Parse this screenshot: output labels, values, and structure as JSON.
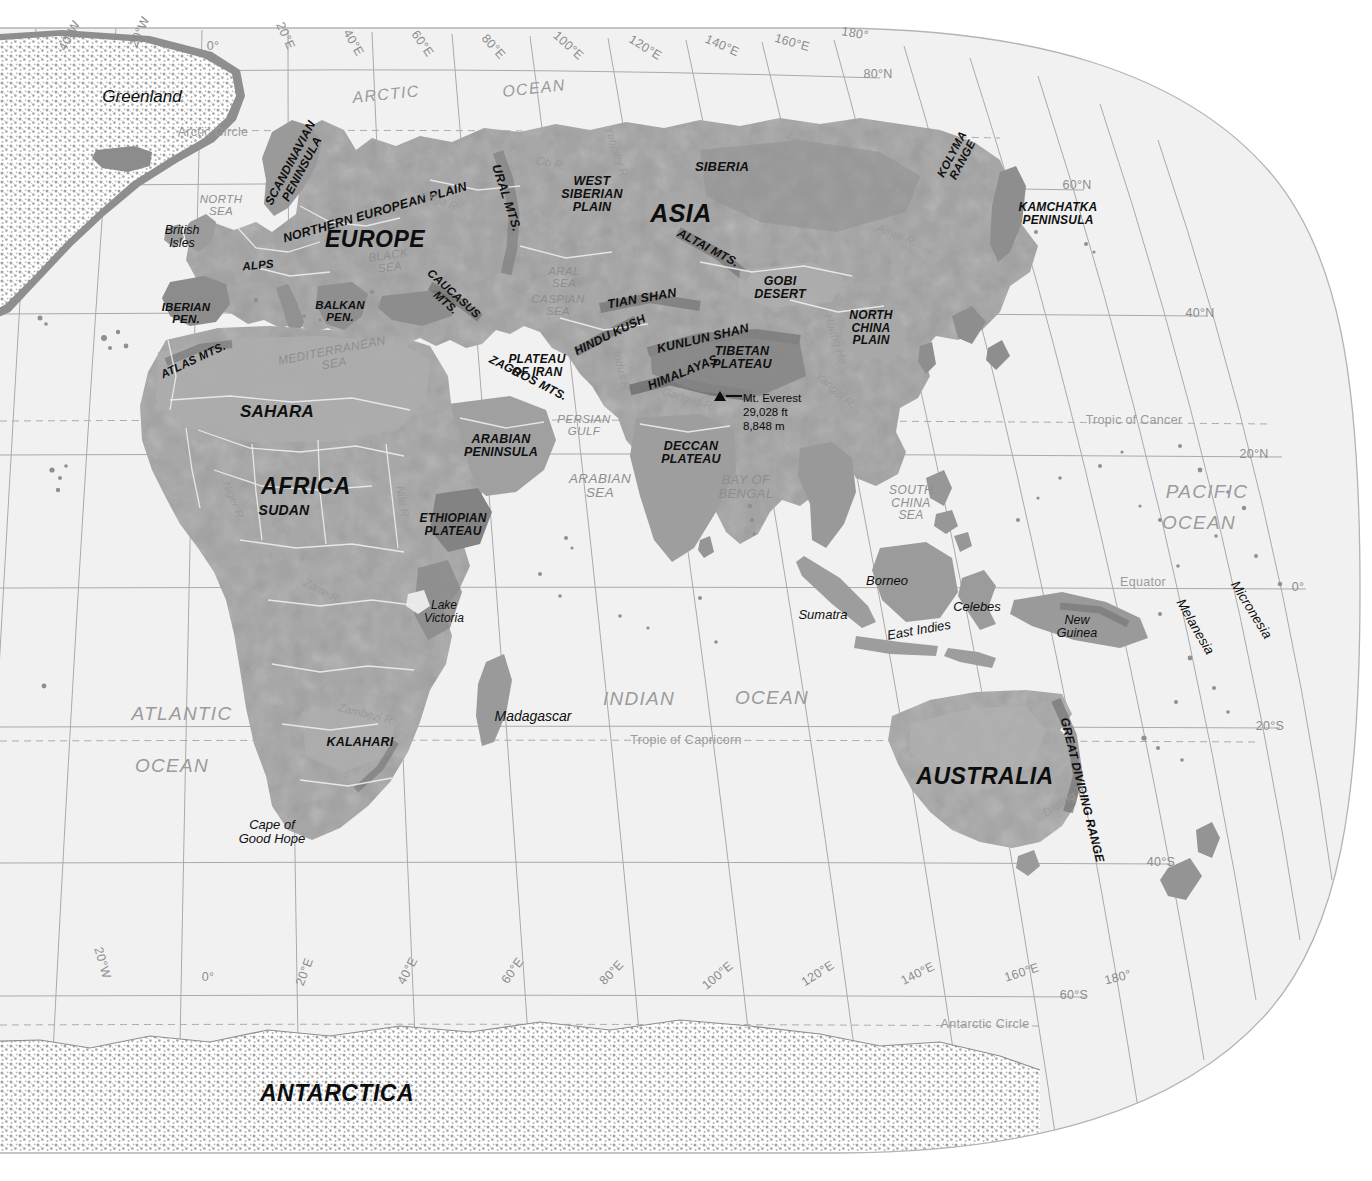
{
  "map": {
    "title": "Physical World Map - Eastern Hemisphere",
    "projection": "oval / interrupted pseudocylindrical",
    "colors": {
      "ocean": "#f1f1f1",
      "land_low": "#a9a9a9",
      "land_mid": "#9a9a9a",
      "land_high": "#868686",
      "land_shadow": "#767676",
      "ice": "#ffffff",
      "graticule": "#9d9d9d",
      "border": "#efefef",
      "label_dark": "#101010",
      "label_water": "#8e8e8e"
    }
  },
  "continents": [
    {
      "label": "EUROPE",
      "x": 375,
      "y": 239,
      "size": 23,
      "rot": 0
    },
    {
      "label": "ASIA",
      "x": 681,
      "y": 213,
      "size": 25,
      "rot": 0
    },
    {
      "label": "AFRICA",
      "x": 306,
      "y": 486,
      "size": 23,
      "rot": 0
    },
    {
      "label": "AUSTRALIA",
      "x": 985,
      "y": 776,
      "size": 23,
      "rot": 0
    },
    {
      "label": "ANTARCTICA",
      "x": 337,
      "y": 1093,
      "size": 23,
      "rot": 0
    }
  ],
  "features": [
    {
      "label": "SCANDINAVIAN\nPENINSULA",
      "x": 296,
      "y": 166,
      "size": 12,
      "rot": -62
    },
    {
      "label": "NORTHERN EUROPEAN PLAIN",
      "x": 375,
      "y": 213,
      "size": 12.5,
      "rot": -16
    },
    {
      "label": "URAL MTS.",
      "x": 506,
      "y": 198,
      "size": 12.5,
      "rot": 72
    },
    {
      "label": "WEST\nSIBERIAN\nPLAIN",
      "x": 592,
      "y": 195,
      "size": 12.5,
      "rot": 0
    },
    {
      "label": "SIBERIA",
      "x": 722,
      "y": 167,
      "size": 13,
      "rot": 0
    },
    {
      "label": "KOLYMA\nRANGE",
      "x": 957,
      "y": 157,
      "size": 11.5,
      "rot": -62
    },
    {
      "label": "KAMCHATKA\nPENINSULA",
      "x": 1058,
      "y": 214,
      "size": 12,
      "rot": 0
    },
    {
      "label": "ALTAI MTS.",
      "x": 708,
      "y": 248,
      "size": 12,
      "rot": 28
    },
    {
      "label": "ALPS",
      "x": 258,
      "y": 265,
      "size": 11.5,
      "rot": -6
    },
    {
      "label": "IBERIAN\nPEN.",
      "x": 186,
      "y": 313,
      "size": 11.5,
      "rot": 0
    },
    {
      "label": "BALKAN\nPEN.",
      "x": 340,
      "y": 311,
      "size": 11.5,
      "rot": 0
    },
    {
      "label": "CAUCASUS\nMTS.",
      "x": 450,
      "y": 298,
      "size": 11.5,
      "rot": 42
    },
    {
      "label": "ATLAS MTS.",
      "x": 193,
      "y": 360,
      "size": 11.5,
      "rot": -25
    },
    {
      "label": "SAHARA",
      "x": 277,
      "y": 412,
      "size": 17,
      "rot": 0
    },
    {
      "label": "SUDAN",
      "x": 284,
      "y": 510,
      "size": 14,
      "rot": 0
    },
    {
      "label": "ETHIOPIAN\nPLATEAU",
      "x": 453,
      "y": 525,
      "size": 12,
      "rot": 0
    },
    {
      "label": "ARABIAN\nPENINSULA",
      "x": 501,
      "y": 446,
      "size": 12.5,
      "rot": 0
    },
    {
      "label": "PLATEAU\nOF IRAN",
      "x": 537,
      "y": 366,
      "size": 12,
      "rot": 0
    },
    {
      "label": "ZAGROS MTS.",
      "x": 528,
      "y": 378,
      "size": 12,
      "rot": 27
    },
    {
      "label": "HINDU KUSH",
      "x": 610,
      "y": 335,
      "size": 12,
      "rot": -26
    },
    {
      "label": "TIAN SHAN",
      "x": 642,
      "y": 299,
      "size": 12.5,
      "rot": -10
    },
    {
      "label": "KUNLUN SHAN",
      "x": 703,
      "y": 339,
      "size": 12.5,
      "rot": -13
    },
    {
      "label": "TIBETAN\nPLATEAU",
      "x": 742,
      "y": 358,
      "size": 12.5,
      "rot": 0
    },
    {
      "label": "HIMALAYAS",
      "x": 683,
      "y": 373,
      "size": 12.5,
      "rot": -22
    },
    {
      "label": "GOBI\nDESERT",
      "x": 780,
      "y": 288,
      "size": 12.5,
      "rot": 0
    },
    {
      "label": "NORTH\nCHINA\nPLAIN",
      "x": 871,
      "y": 328,
      "size": 12,
      "rot": 0
    },
    {
      "label": "DECCAN\nPLATEAU",
      "x": 691,
      "y": 453,
      "size": 12.5,
      "rot": 0
    },
    {
      "label": "KALAHARI",
      "x": 360,
      "y": 743,
      "size": 12.5,
      "rot": 0
    },
    {
      "label": "GREAT DIVIDING RANGE",
      "x": 1082,
      "y": 790,
      "size": 12,
      "rot": 76
    }
  ],
  "places": [
    {
      "label": "Greenland",
      "x": 142,
      "y": 97,
      "size": 17,
      "rot": 0
    },
    {
      "label": "British\nIsles",
      "x": 182,
      "y": 237,
      "size": 12.5,
      "rot": 0
    },
    {
      "label": "Borneo",
      "x": 887,
      "y": 581,
      "size": 13,
      "rot": 0
    },
    {
      "label": "Sumatra",
      "x": 823,
      "y": 615,
      "size": 13,
      "rot": 0
    },
    {
      "label": "Celebes",
      "x": 977,
      "y": 607,
      "size": 13,
      "rot": 0
    },
    {
      "label": "East Indies",
      "x": 919,
      "y": 630,
      "size": 13,
      "rot": -10
    },
    {
      "label": "New\nGuinea",
      "x": 1077,
      "y": 627,
      "size": 12.5,
      "rot": 0
    },
    {
      "label": "Madagascar",
      "x": 533,
      "y": 716,
      "size": 14,
      "rot": 0
    },
    {
      "label": "Lake\nVictoria",
      "x": 444,
      "y": 612,
      "size": 12,
      "rot": 0
    },
    {
      "label": "Micronesia",
      "x": 1251,
      "y": 610,
      "size": 13.5,
      "rot": 58
    },
    {
      "label": "Melanesia",
      "x": 1195,
      "y": 627,
      "size": 13.5,
      "rot": 60
    },
    {
      "label": "Cape of\nGood Hope",
      "x": 272,
      "y": 832,
      "size": 13,
      "rot": 0
    }
  ],
  "waters": [
    {
      "label": "ARCTIC",
      "x": 386,
      "y": 95,
      "size": 16,
      "rot": -6,
      "cls": "water-big"
    },
    {
      "label": "OCEAN",
      "x": 534,
      "y": 89,
      "size": 16,
      "rot": -6,
      "cls": "water-big"
    },
    {
      "label": "NORTH\nSEA",
      "x": 221,
      "y": 205,
      "size": 11.5,
      "rot": 0,
      "cls": "water"
    },
    {
      "label": "BLACK\nSEA",
      "x": 389,
      "y": 261,
      "size": 11.5,
      "rot": -8,
      "cls": "water"
    },
    {
      "label": "ARAL\nSEA",
      "x": 564,
      "y": 277,
      "size": 11.5,
      "rot": 0,
      "cls": "water"
    },
    {
      "label": "CASPIAN\nSEA",
      "x": 558,
      "y": 305,
      "size": 11.5,
      "rot": 0,
      "cls": "water"
    },
    {
      "label": "MEDITERRANEAN\nSEA",
      "x": 333,
      "y": 357,
      "size": 12,
      "rot": -11,
      "cls": "water"
    },
    {
      "label": "PERSIAN\nGULF",
      "x": 584,
      "y": 425,
      "size": 11.5,
      "rot": 0,
      "cls": "water"
    },
    {
      "label": "ARABIAN\nSEA",
      "x": 600,
      "y": 486,
      "size": 13.5,
      "rot": 0,
      "cls": "water"
    },
    {
      "label": "BAY OF\nBENGAL",
      "x": 746,
      "y": 487,
      "size": 13,
      "rot": 0,
      "cls": "water"
    },
    {
      "label": "SOUTH\nCHINA\nSEA",
      "x": 911,
      "y": 503,
      "size": 12,
      "rot": 0,
      "cls": "water"
    },
    {
      "label": "PACIFIC",
      "x": 1207,
      "y": 492,
      "size": 19,
      "rot": 0,
      "cls": "water-big"
    },
    {
      "label": "OCEAN",
      "x": 1199,
      "y": 523,
      "size": 19,
      "rot": 0,
      "cls": "water-big"
    },
    {
      "label": "INDIAN",
      "x": 639,
      "y": 699,
      "size": 19,
      "rot": 0,
      "cls": "water-big"
    },
    {
      "label": "OCEAN",
      "x": 772,
      "y": 698,
      "size": 19,
      "rot": 0,
      "cls": "water-big"
    },
    {
      "label": "ATLANTIC",
      "x": 182,
      "y": 714,
      "size": 19,
      "rot": 0,
      "cls": "water-big"
    },
    {
      "label": "OCEAN",
      "x": 172,
      "y": 766,
      "size": 19,
      "rot": 0,
      "cls": "water-big"
    }
  ],
  "rivers": [
    {
      "label": "Volga R.",
      "x": 440,
      "y": 200,
      "size": 11.5,
      "rot": 22
    },
    {
      "label": "Ob R.",
      "x": 551,
      "y": 163,
      "size": 11.5,
      "rot": 10
    },
    {
      "label": "Yenisey R.",
      "x": 617,
      "y": 153,
      "size": 11.5,
      "rot": 72
    },
    {
      "label": "Lena R.",
      "x": 805,
      "y": 146,
      "size": 11.5,
      "rot": 36
    },
    {
      "label": "Amur R.",
      "x": 897,
      "y": 235,
      "size": 11.5,
      "rot": 22
    },
    {
      "label": "L. Baikal",
      "x": 809,
      "y": 217,
      "size": 11.5,
      "rot": 8
    },
    {
      "label": "Huang He",
      "x": 836,
      "y": 339,
      "size": 11.5,
      "rot": 72
    },
    {
      "label": "Yangzi R.",
      "x": 836,
      "y": 390,
      "size": 11.5,
      "rot": 40
    },
    {
      "label": "Indus R.",
      "x": 622,
      "y": 372,
      "size": 11.5,
      "rot": 76
    },
    {
      "label": "Ganges R.",
      "x": 689,
      "y": 399,
      "size": 11.5,
      "rot": 17
    },
    {
      "label": "Niger R.",
      "x": 234,
      "y": 501,
      "size": 11.5,
      "rot": 68
    },
    {
      "label": "Nile R.",
      "x": 403,
      "y": 503,
      "size": 11.5,
      "rot": 80
    },
    {
      "label": "Zaire R.",
      "x": 323,
      "y": 591,
      "size": 11.5,
      "rot": 28
    },
    {
      "label": "Zambezi R.",
      "x": 367,
      "y": 714,
      "size": 11.5,
      "rot": 14
    },
    {
      "label": "Darling R.",
      "x": 1065,
      "y": 800,
      "size": 11.5,
      "rot": -33
    }
  ],
  "graticule_top": [
    {
      "label": "40°W",
      "x": 70,
      "y": 36,
      "rot": -62
    },
    {
      "label": "20°W",
      "x": 140,
      "y": 32,
      "rot": -66
    },
    {
      "label": "0°",
      "x": 213,
      "y": 47,
      "rot": 0
    },
    {
      "label": "20°E",
      "x": 285,
      "y": 36,
      "rot": 66
    },
    {
      "label": "40°E",
      "x": 353,
      "y": 43,
      "rot": 60
    },
    {
      "label": "60°E",
      "x": 422,
      "y": 44,
      "rot": 55
    },
    {
      "label": "80°E",
      "x": 493,
      "y": 47,
      "rot": 48
    },
    {
      "label": "100°E",
      "x": 568,
      "y": 46,
      "rot": 42
    },
    {
      "label": "120°E",
      "x": 645,
      "y": 48,
      "rot": 32
    },
    {
      "label": "140°E",
      "x": 722,
      "y": 46,
      "rot": 24
    },
    {
      "label": "160°E",
      "x": 792,
      "y": 43,
      "rot": 16
    },
    {
      "label": "180°",
      "x": 855,
      "y": 34,
      "rot": 10
    }
  ],
  "graticule_bottom": [
    {
      "label": "20°W",
      "x": 102,
      "y": 963,
      "rot": 74
    },
    {
      "label": "0°",
      "x": 208,
      "y": 978,
      "rot": 0
    },
    {
      "label": "20°E",
      "x": 305,
      "y": 972,
      "rot": -70
    },
    {
      "label": "40°E",
      "x": 408,
      "y": 971,
      "rot": -62
    },
    {
      "label": "60°E",
      "x": 513,
      "y": 971,
      "rot": -54
    },
    {
      "label": "80°E",
      "x": 612,
      "y": 973,
      "rot": -46
    },
    {
      "label": "100°E",
      "x": 718,
      "y": 976,
      "rot": -40
    },
    {
      "label": "120°E",
      "x": 818,
      "y": 974,
      "rot": -32
    },
    {
      "label": "140°E",
      "x": 918,
      "y": 974,
      "rot": -26
    },
    {
      "label": "160°E",
      "x": 1022,
      "y": 973,
      "rot": -18
    },
    {
      "label": "180°",
      "x": 1118,
      "y": 978,
      "rot": -14
    }
  ],
  "graticule_right": [
    {
      "label": "80°N",
      "x": 878,
      "y": 75
    },
    {
      "label": "60°N",
      "x": 1077,
      "y": 186
    },
    {
      "label": "40°N",
      "x": 1200,
      "y": 314
    },
    {
      "label": "20°N",
      "x": 1254,
      "y": 455
    },
    {
      "label": "0°",
      "x": 1298,
      "y": 588
    },
    {
      "label": "20°S",
      "x": 1270,
      "y": 727
    },
    {
      "label": "40°S",
      "x": 1161,
      "y": 863
    },
    {
      "label": "60°S",
      "x": 1074,
      "y": 996
    }
  ],
  "special_lines": [
    {
      "label": "Arctic Circle",
      "x": 213,
      "y": 133
    },
    {
      "label": "Tropic of Cancer",
      "x": 1134,
      "y": 421
    },
    {
      "label": "Equator",
      "x": 1143,
      "y": 583
    },
    {
      "label": "Tropic of Capricorn",
      "x": 686,
      "y": 741
    },
    {
      "label": "Antarctic Circle",
      "x": 985,
      "y": 1025
    }
  ],
  "annotations": [
    {
      "name": "mount-everest",
      "marker_x": 720,
      "marker_y": 396,
      "text": "Mt. Everest\n29,028 ft\n8,848 m",
      "text_x": 743,
      "text_y": 395
    }
  ]
}
